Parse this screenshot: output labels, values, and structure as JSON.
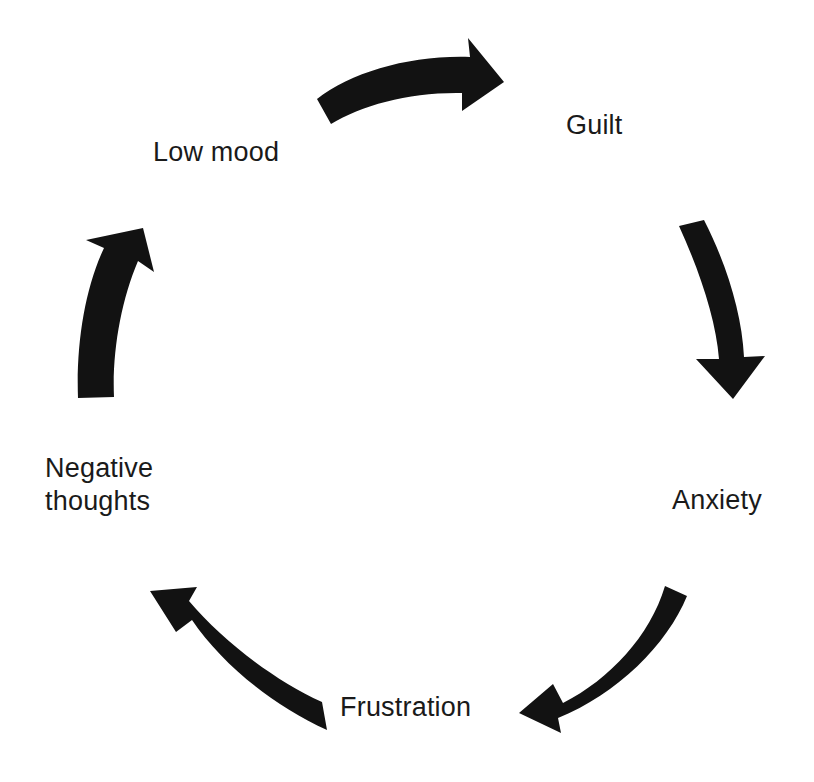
{
  "diagram": {
    "background_color": "#ffffff",
    "arrow_color": "#121212",
    "text_color": "#1a1a1a",
    "nodes": [
      {
        "id": "low-mood",
        "label": "Low mood"
      },
      {
        "id": "guilt",
        "label": "Guilt"
      },
      {
        "id": "anxiety",
        "label": "Anxiety"
      },
      {
        "id": "frustration",
        "label": "Frustration"
      },
      {
        "id": "negative-thoughts",
        "label": "Negative\nthoughts"
      }
    ],
    "arrows": [
      {
        "id": "arrow-low-mood-to-guilt",
        "from": "low-mood",
        "to": "guilt",
        "direction": "right"
      },
      {
        "id": "arrow-guilt-to-anxiety",
        "from": "guilt",
        "to": "anxiety",
        "direction": "down"
      },
      {
        "id": "arrow-anxiety-to-frustration",
        "from": "anxiety",
        "to": "frustration",
        "direction": "down-left"
      },
      {
        "id": "arrow-frustration-to-negative-thoughts",
        "from": "frustration",
        "to": "negative-thoughts",
        "direction": "up-left"
      },
      {
        "id": "arrow-negative-thoughts-to-low-mood",
        "from": "negative-thoughts",
        "to": "low-mood",
        "direction": "up"
      }
    ]
  }
}
